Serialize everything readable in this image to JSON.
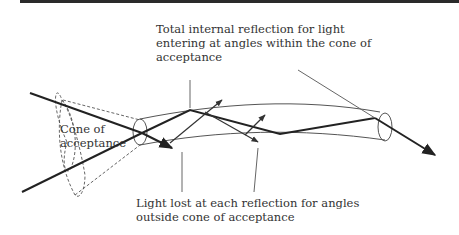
{
  "diagram": {
    "labels": {
      "top": [
        "Total internal reflection for light",
        "entering at angles within the cone of",
        "acceptance"
      ],
      "cone": [
        "Cone of",
        "acceptance"
      ],
      "bottom": [
        "Light lost at each reflection for angles",
        "outside cone of acceptance"
      ]
    },
    "colors": {
      "ray": "#222222",
      "fiber": "#555555",
      "leader": "#666666",
      "cone": "#555555",
      "text": "#333333",
      "topbar": "#2a2a2a"
    }
  }
}
